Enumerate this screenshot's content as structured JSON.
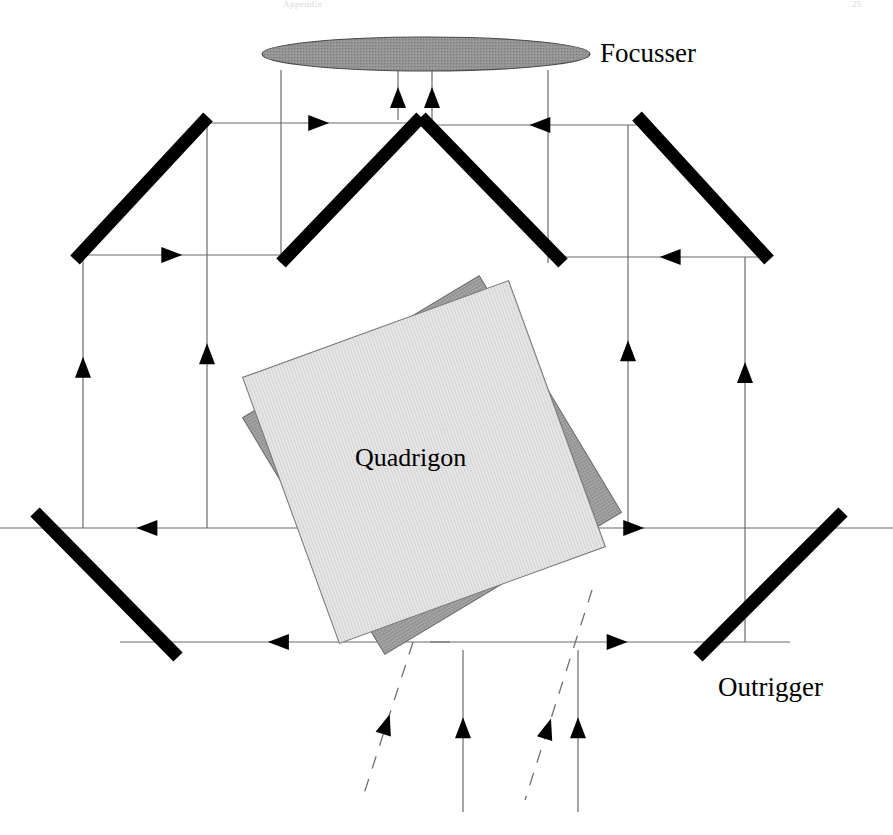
{
  "figure": {
    "domain": "diagram",
    "kind": "optical ray-path schematic",
    "background_color": "#ffffff",
    "width": 893,
    "height": 835
  },
  "labels": {
    "focusser": "Focusser",
    "outrigger": "Outrigger",
    "quadrigon": "Quadrigon"
  },
  "header": {
    "left_text": "Appendix",
    "right_text": "25"
  },
  "colors": {
    "mirror": "#000000",
    "ray": "#6b6b6b",
    "arrow": "#000000",
    "focusser_fill": "#8f8f8f",
    "focusser_stroke": "#4a4a4a",
    "quadrigon_front_fill": "#e3e3e3",
    "quadrigon_front_stroke": "#7a7a7a",
    "quadrigon_back_fill": "#9a9a9a",
    "quadrigon_back_stroke": "#6e6e6e",
    "dashed_ray": "#707070"
  },
  "components": {
    "focusser": {
      "name": "Focusser",
      "shape": "ellipse",
      "cx": 426,
      "cy": 54,
      "rx": 164,
      "ry": 17
    },
    "quadrigon_back_square": {
      "name": "Quadrigon rear element",
      "shape": "rotated-square",
      "cx": 432,
      "cy": 465,
      "size": 276,
      "rotation_deg": -31
    },
    "quadrigon_front_square": {
      "name": "Quadrigon front element",
      "shape": "rotated-square",
      "cx": 424,
      "cy": 462,
      "size": 283,
      "rotation_deg": -20
    },
    "mirrors": [
      {
        "id": "mirror-upper-left",
        "x1": 75,
        "y1": 260,
        "x2": 208,
        "y2": 117,
        "thickness": 13
      },
      {
        "id": "mirror-roof-left",
        "x1": 281,
        "y1": 263,
        "x2": 421,
        "y2": 117,
        "thickness": 13
      },
      {
        "id": "mirror-roof-right",
        "x1": 421,
        "y1": 117,
        "x2": 563,
        "y2": 263,
        "thickness": 13
      },
      {
        "id": "mirror-upper-right",
        "x1": 637,
        "y1": 116,
        "x2": 769,
        "y2": 260,
        "thickness": 13
      },
      {
        "id": "mirror-lower-left",
        "x1": 35,
        "y1": 512,
        "x2": 178,
        "y2": 657,
        "thickness": 13
      },
      {
        "id": "mirror-lower-right",
        "x1": 698,
        "y1": 657,
        "x2": 843,
        "y2": 512,
        "thickness": 13
      }
    ],
    "horizontal_rays": [
      {
        "id": "ray-top-left",
        "x1": 208,
        "y1": 123,
        "x2": 421,
        "y2": 123,
        "arrow": "right",
        "arrow_at": 0.52
      },
      {
        "id": "ray-top-right",
        "x1": 421,
        "y1": 125,
        "x2": 637,
        "y2": 125,
        "arrow": "left",
        "arrow_at": 0.55
      },
      {
        "id": "ray-upper-left-lo",
        "x1": 75,
        "y1": 255,
        "x2": 281,
        "y2": 255,
        "arrow": "right",
        "arrow_at": 0.47
      },
      {
        "id": "ray-upper-right-lo",
        "x1": 563,
        "y1": 257,
        "x2": 769,
        "y2": 257,
        "arrow": "left",
        "arrow_at": 0.52
      },
      {
        "id": "ray-mid-left",
        "x1": 0,
        "y1": 528,
        "x2": 445,
        "y2": 528,
        "arrow": "left",
        "arrow_at": 0.33
      },
      {
        "id": "ray-mid-right",
        "x1": 430,
        "y1": 528,
        "x2": 893,
        "y2": 528,
        "arrow": "right",
        "arrow_at": 0.44
      },
      {
        "id": "ray-low-left",
        "x1": 120,
        "y1": 642,
        "x2": 450,
        "y2": 642,
        "arrow": "left",
        "arrow_at": 0.48
      },
      {
        "id": "ray-low-right",
        "x1": 430,
        "y1": 642,
        "x2": 790,
        "y2": 642,
        "arrow": "right",
        "arrow_at": 0.52
      }
    ],
    "vertical_rays": [
      {
        "id": "vray-far-left",
        "x": 83,
        "y1": 260,
        "y2": 528,
        "arrow": "up",
        "arrow_at": 0.4
      },
      {
        "id": "vray-inner-left",
        "x": 207,
        "y1": 123,
        "y2": 528,
        "arrow": "up",
        "arrow_at": 0.57
      },
      {
        "id": "vray-focus-l-out",
        "x": 281,
        "y1": 70,
        "y2": 263,
        "arrow": "none"
      },
      {
        "id": "vray-focus-l-in",
        "x": 398,
        "y1": 70,
        "y2": 120,
        "arrow": "up",
        "arrow_at": 0.55
      },
      {
        "id": "vray-focus-r-in",
        "x": 432,
        "y1": 70,
        "y2": 120,
        "arrow": "up",
        "arrow_at": 0.55
      },
      {
        "id": "vray-focus-r-out",
        "x": 548,
        "y1": 70,
        "y2": 263,
        "arrow": "none"
      },
      {
        "id": "vray-inner-right",
        "x": 628,
        "y1": 125,
        "y2": 528,
        "arrow": "up",
        "arrow_at": 0.56
      },
      {
        "id": "vray-far-right",
        "x": 745,
        "y1": 257,
        "y2": 642,
        "arrow": "up",
        "arrow_at": 0.3
      },
      {
        "id": "vray-bottom-solid-left",
        "x": 463,
        "y1": 650,
        "y2": 812,
        "arrow": "up",
        "arrow_at": 0.48
      },
      {
        "id": "vray-bottom-solid-right",
        "x": 578,
        "y1": 650,
        "y2": 812,
        "arrow": "up",
        "arrow_at": 0.48
      }
    ],
    "dashed_rays": [
      {
        "id": "dray-left",
        "x1": 413,
        "y1": 642,
        "x2": 362,
        "y2": 800,
        "arrow": "up",
        "arrow_at": 0.52
      },
      {
        "id": "dray-right",
        "x1": 592,
        "y1": 590,
        "x2": 525,
        "y2": 800,
        "arrow": "up",
        "arrow_at": 0.66
      }
    ]
  }
}
